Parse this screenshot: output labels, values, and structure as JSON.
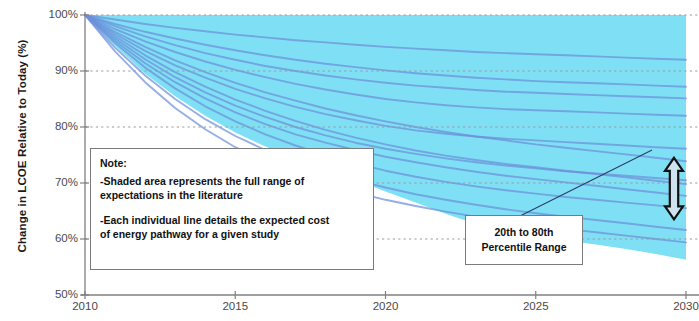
{
  "chart_data": {
    "type": "area",
    "title": "",
    "subtitle": "",
    "xlabel": "",
    "ylabel": "Change in LCOE  Relative to Today (%)",
    "xlim": [
      2010,
      2030
    ],
    "ylim": [
      50,
      100
    ],
    "x_ticks": [
      2010,
      2015,
      2020,
      2025,
      2030
    ],
    "x_tick_labels": [
      "2010",
      "2015",
      "2020",
      "2025",
      "2030"
    ],
    "y_ticks": [
      50,
      60,
      70,
      80,
      90,
      100
    ],
    "y_tick_labels": [
      "50%",
      "60%",
      "70%",
      "80%",
      "90%",
      "100%"
    ],
    "grid": true,
    "grid_style": "dotted-horizontal",
    "legend": null,
    "band_fill_color": "#7FE0F5",
    "line_color": "#6C8FDA",
    "x": [
      2010,
      2011,
      2012,
      2013,
      2014,
      2015,
      2016,
      2017,
      2018,
      2019,
      2020,
      2021,
      2022,
      2023,
      2024,
      2025,
      2026,
      2027,
      2028,
      2029,
      2030
    ],
    "band_upper": [
      100,
      100,
      100,
      100,
      100,
      100,
      100,
      100,
      100,
      100,
      100,
      100,
      100,
      100,
      100,
      100,
      100,
      100,
      100,
      100,
      100
    ],
    "band_lower": [
      100,
      94.5,
      89.5,
      85.5,
      82.0,
      79.0,
      76.5,
      74.5,
      72.5,
      70.5,
      68.5,
      66.5,
      64.5,
      62.7,
      61.5,
      60.5,
      59.7,
      59.0,
      58.2,
      57.3,
      56.3
    ],
    "series": [
      {
        "name": "study-1",
        "values": [
          100,
          99.2,
          98.4,
          97.7,
          97.1,
          96.5,
          96.0,
          95.5,
          95.1,
          94.7,
          94.3,
          94.0,
          93.7,
          93.4,
          93.2,
          93.0,
          92.8,
          92.6,
          92.4,
          92.2,
          92.0
        ]
      },
      {
        "name": "study-2",
        "values": [
          100,
          98.4,
          97.0,
          95.8,
          94.7,
          93.7,
          92.8,
          92.0,
          91.3,
          90.7,
          90.1,
          89.6,
          89.2,
          88.8,
          88.5,
          88.2,
          88.0,
          87.8,
          87.6,
          87.4,
          87.2
        ]
      },
      {
        "name": "study-3",
        "values": [
          100,
          97.5,
          95.3,
          93.4,
          91.7,
          90.2,
          88.9,
          87.7,
          86.7,
          85.8,
          85.0,
          84.4,
          83.9,
          83.5,
          83.2,
          83.0,
          82.8,
          82.6,
          82.4,
          82.2,
          82.0
        ]
      },
      {
        "name": "study-4",
        "values": [
          100,
          96.6,
          93.6,
          91.0,
          88.8,
          86.8,
          85.1,
          83.6,
          82.3,
          81.2,
          80.2,
          79.4,
          78.8,
          78.3,
          77.9,
          77.6,
          77.3,
          77.0,
          76.7,
          76.4,
          76.1
        ]
      },
      {
        "name": "study-5",
        "values": [
          100,
          95.8,
          92.1,
          88.9,
          86.2,
          83.8,
          81.8,
          80.0,
          78.5,
          77.2,
          76.1,
          75.2,
          74.4,
          73.7,
          73.1,
          72.6,
          72.1,
          71.7,
          71.3,
          70.9,
          70.5
        ]
      },
      {
        "name": "study-6",
        "values": [
          100,
          95.0,
          90.6,
          86.9,
          83.7,
          81.0,
          78.7,
          76.7,
          75.0,
          73.5,
          72.2,
          71.1,
          70.2,
          69.4,
          68.7,
          68.1,
          67.5,
          67.0,
          66.5,
          66.0,
          65.5
        ]
      },
      {
        "name": "study-7",
        "values": [
          100,
          96.2,
          92.8,
          89.8,
          87.2,
          84.9,
          82.9,
          81.1,
          79.5,
          78.1,
          76.9,
          75.8,
          74.9,
          74.1,
          73.4,
          72.8,
          72.2,
          71.6,
          71.0,
          70.4,
          69.8
        ]
      },
      {
        "name": "study-8",
        "values": [
          100,
          97.0,
          94.3,
          91.9,
          89.8,
          87.9,
          86.2,
          84.7,
          83.3,
          82.1,
          81.0,
          80.0,
          79.1,
          78.3,
          77.6,
          76.9,
          76.3,
          75.7,
          75.1,
          74.5,
          73.9
        ]
      },
      {
        "name": "study-9",
        "values": [
          100,
          94.2,
          89.2,
          85.0,
          81.4,
          78.4,
          75.9,
          73.8,
          72.0,
          70.5,
          69.2,
          68.0,
          67.0,
          66.1,
          65.3,
          64.6,
          64.0,
          63.4,
          62.8,
          62.2,
          61.6
        ]
      },
      {
        "name": "study-10",
        "values": [
          100,
          93.5,
          88.0,
          83.4,
          79.6,
          76.4,
          73.8,
          71.6,
          69.8,
          68.3,
          67.0,
          65.9,
          64.9,
          64.0,
          63.2,
          62.5,
          61.8,
          61.2,
          60.6,
          60.0,
          59.4
        ]
      },
      {
        "name": "study-11",
        "values": [
          100,
          98.0,
          96.2,
          94.6,
          93.2,
          92.0,
          90.9,
          90.0,
          89.2,
          88.5,
          87.9,
          87.4,
          87.0,
          86.6,
          86.3,
          86.1,
          85.9,
          85.7,
          85.5,
          85.3,
          85.1
        ]
      },
      {
        "name": "study-12",
        "values": [
          100,
          95.4,
          91.4,
          88.0,
          85.1,
          82.6,
          80.5,
          78.7,
          77.2,
          75.9,
          74.7,
          73.7,
          72.8,
          72.0,
          71.3,
          70.7,
          70.1,
          69.5,
          68.9,
          68.3,
          67.7
        ]
      }
    ],
    "annotations": [
      {
        "name": "note-box",
        "title": "Note:",
        "lines": [
          "-Shaded area represents the full range of",
          "expectations in the literature",
          "-Each individual line details the expected cost",
          "of energy pathway  for a given study"
        ]
      },
      {
        "name": "percentile-callout",
        "lines": [
          "20th to 80th",
          "Percentile Range"
        ],
        "arrow": {
          "type": "double-headed-vertical",
          "y_top_pct": 74.5,
          "y_bottom_pct": 63.5,
          "x_year": 2029.6
        }
      }
    ]
  },
  "axis": {
    "y_title": "Change in LCOE  Relative to Today (%)",
    "y_tick_labels": [
      "100%",
      "90%",
      "80%",
      "70%",
      "60%",
      "50%"
    ],
    "x_tick_labels": [
      "2010",
      "2015",
      "2020",
      "2025",
      "2030"
    ]
  },
  "note": {
    "title": "Note:",
    "line1": "-Shaded area represents the full range of",
    "line2": "expectations in the literature",
    "line3": "-Each individual line details the expected cost",
    "line4": "of energy pathway  for a given study"
  },
  "callout": {
    "line1": "20th to 80th",
    "line2": "Percentile Range"
  },
  "colors": {
    "band_fill": "#7FE0F5",
    "band_line": "#6C8FDA",
    "axis": "#808080",
    "grid": "#9a9a9a",
    "text": "#1a1a1a"
  }
}
